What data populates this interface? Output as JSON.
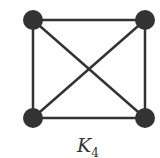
{
  "diagram": {
    "title": "K",
    "title_subscript": "4",
    "colors": {
      "node": "#333333",
      "edge": "#333333",
      "background": "#ffffff"
    },
    "nodes": [
      {
        "id": "a",
        "x": 33,
        "y": 20
      },
      {
        "id": "b",
        "x": 145,
        "y": 20
      },
      {
        "id": "c",
        "x": 33,
        "y": 118
      },
      {
        "id": "d",
        "x": 145,
        "y": 118
      }
    ],
    "edges": [
      [
        "a",
        "b"
      ],
      [
        "a",
        "c"
      ],
      [
        "a",
        "d"
      ],
      [
        "b",
        "c"
      ],
      [
        "b",
        "d"
      ],
      [
        "c",
        "d"
      ]
    ]
  }
}
